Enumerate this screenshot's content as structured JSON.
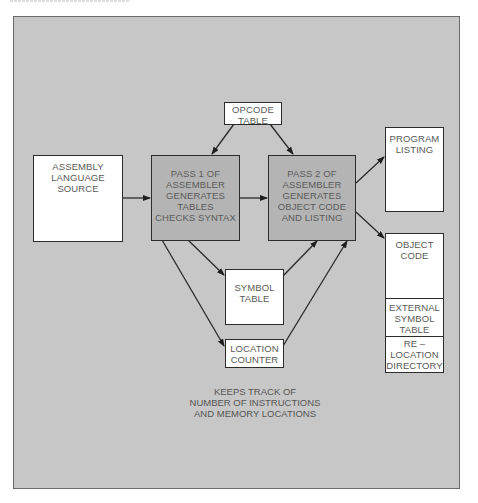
{
  "diagram": {
    "title_fragment": "",
    "nodes": {
      "opcode_table": [
        "OPCODE",
        "TABLE"
      ],
      "assembly_source": [
        "ASSEMBLY",
        "LANGUAGE",
        "SOURCE"
      ],
      "pass1": [
        "PASS 1 OF",
        "ASSEMBLER",
        "GENERATES",
        "TABLES",
        "CHECKS SYNTAX"
      ],
      "pass2": [
        "PASS 2 OF",
        "ASSEMBLER",
        "GENERATES",
        "OBJECT CODE",
        "AND LISTING"
      ],
      "program_listing": [
        "PROGRAM",
        "LISTING"
      ],
      "object_code": [
        "OBJECT",
        "CODE"
      ],
      "external_symbol_table": [
        "EXTERNAL",
        "SYMBOL",
        "TABLE"
      ],
      "relocation_directory": [
        "RE –",
        "LOCATION",
        "DIRECTORY"
      ],
      "symbol_table": [
        "SYMBOL",
        "TABLE"
      ],
      "location_counter": [
        "LOCATION",
        "COUNTER"
      ]
    },
    "caption": [
      "KEEPS TRACK OF",
      "NUMBER OF INSTRUCTIONS",
      "AND MEMORY LOCATIONS"
    ],
    "edges": [
      {
        "from": "assembly_source",
        "to": "pass1"
      },
      {
        "from": "opcode_table",
        "to": "pass1"
      },
      {
        "from": "opcode_table",
        "to": "pass2"
      },
      {
        "from": "pass1",
        "to": "pass2"
      },
      {
        "from": "pass1",
        "to": "symbol_table"
      },
      {
        "from": "pass1",
        "to": "location_counter"
      },
      {
        "from": "symbol_table",
        "to": "pass2"
      },
      {
        "from": "location_counter",
        "to": "pass2"
      },
      {
        "from": "pass2",
        "to": "program_listing"
      },
      {
        "from": "pass2",
        "to": "object_code"
      }
    ],
    "colors": {
      "background": "#c7c7c7",
      "box": "#ffffff",
      "shaded_box": "#b4b4b4",
      "stroke": "#2c2c2c",
      "text": "#5a5a5a"
    }
  }
}
